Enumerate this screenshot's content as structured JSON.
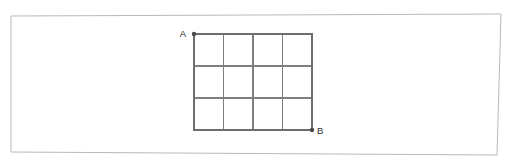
{
  "figure": {
    "background_color": "#ffffff",
    "frame": {
      "name": "outer-frame",
      "stroke_color": "#b9b9b9",
      "corners": [
        {
          "x": 11,
          "y": 16
        },
        {
          "x": 501,
          "y": 14
        },
        {
          "x": 497,
          "y": 155
        },
        {
          "x": 11,
          "y": 152
        }
      ]
    },
    "grid": {
      "columns": 4,
      "rows": 3,
      "cell_count": 12,
      "stroke_color": "#7e7e7e",
      "outline_color": "#6e6e6e",
      "bounds": {
        "left": 194,
        "top": 34,
        "right": 312,
        "bottom": 130
      },
      "vertical_line_x": [
        194,
        223.5,
        253,
        282.5,
        312
      ],
      "horizontal_line_y": [
        34,
        66,
        98,
        130
      ]
    },
    "points": [
      {
        "id": "A",
        "label": "A",
        "x": 194,
        "y": 34,
        "label_x": 186,
        "label_y": 37,
        "dot_radius": 2.2,
        "dot_color": "#4a4a4a",
        "position": "top-left"
      },
      {
        "id": "B",
        "label": "B",
        "x": 312,
        "y": 130,
        "label_x": 317,
        "label_y": 134,
        "dot_radius": 2.2,
        "dot_color": "#4a4a4a",
        "position": "bottom-right"
      }
    ]
  },
  "chart_data": {
    "type": "diagram",
    "grid_columns": 4,
    "grid_rows": 3,
    "total_cells": 12,
    "labels": [
      "A",
      "B"
    ],
    "label_positions": [
      "top-left",
      "bottom-right"
    ],
    "xlabel": "",
    "ylabel": ""
  }
}
